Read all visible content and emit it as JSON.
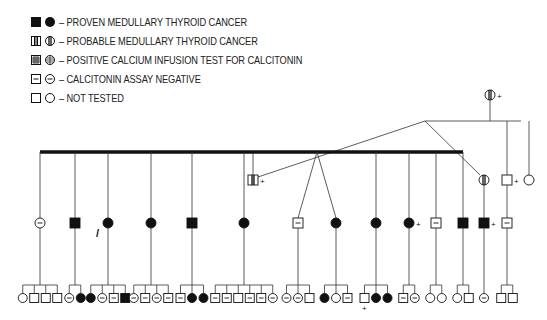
{
  "legend": [
    {
      "symbol": "filled",
      "label": "– PROVEN MEDULLARY THYROID CANCER"
    },
    {
      "symbol": "half-striped",
      "label": "– PROBABLE MEDULLARY THYROID CANCER"
    },
    {
      "symbol": "grid",
      "label": "– POSITIVE CALCIUM INFUSION TEST FOR CALCITONIN"
    },
    {
      "symbol": "minus",
      "label": "– CALCITONIN ASSAY NEGATIVE"
    },
    {
      "symbol": "empty",
      "label": "– NOT TESTED"
    }
  ],
  "colors": {
    "ink": "#111111",
    "line": "#333333"
  },
  "annotations": {
    "deceased_mark": "+",
    "proband_arrow": "↗"
  },
  "pedigree": {
    "generation_I": [
      {
        "sex": "female",
        "status": "half-striped",
        "deceased": true
      }
    ],
    "generation_II": [
      {
        "sex": "male",
        "status": "half-striped",
        "deceased": true
      },
      {
        "sex": "female",
        "status": "half-striped",
        "deceased": false
      },
      {
        "sex": "male",
        "status": "empty",
        "deceased": true
      },
      {
        "sex": "female",
        "status": "empty",
        "deceased": false
      }
    ],
    "generation_III": [
      {
        "sex": "female",
        "status": "minus",
        "children": [
          "F:empty",
          "M:empty",
          "M:empty",
          "M:empty"
        ]
      },
      {
        "sex": "male",
        "status": "filled",
        "children": [
          "F:minus",
          "F:filled"
        ]
      },
      {
        "sex": "female",
        "status": "filled",
        "proband": true,
        "children": [
          "F:filled",
          "F:minus",
          "M:minus",
          "M:filled"
        ]
      },
      {
        "sex": "female",
        "status": "filled",
        "children": [
          "F:minus",
          "M:minus",
          "F:minus",
          "M:minus"
        ]
      },
      {
        "sex": "male",
        "status": "filled",
        "children": [
          "M:minus",
          "F:filled",
          "F:filled"
        ]
      },
      {
        "sex": "female",
        "status": "filled",
        "children": [
          "M:minus",
          "M:minus",
          "M:empty",
          "M:minus",
          "M:minus",
          "F:minus"
        ]
      },
      {
        "sex": "male",
        "status": "minus",
        "twin": true,
        "children": [
          "F:minus",
          "F:minus",
          "M:empty"
        ]
      },
      {
        "sex": "female",
        "status": "filled",
        "twin": true,
        "children": [
          "F:filled",
          "F:empty",
          "M:minus"
        ]
      },
      {
        "sex": "female",
        "status": "filled",
        "children": [
          "M:empty+",
          "F:filled",
          "F:filled"
        ]
      },
      {
        "sex": "female",
        "status": "filled",
        "deceased": true,
        "children": [
          "M:minus",
          "F:minus"
        ]
      },
      {
        "sex": "male",
        "status": "minus",
        "children": [
          "F:empty",
          "F:empty"
        ]
      },
      {
        "sex": "male",
        "status": "filled",
        "children": [
          "F:empty",
          "M:empty"
        ]
      },
      {
        "sex": "male",
        "status": "filled",
        "deceased": true,
        "branch": "II-2",
        "children": [
          "F:minus"
        ]
      },
      {
        "sex": "male",
        "status": "minus",
        "branch": "II-3",
        "children": [
          "M:empty",
          "M:empty"
        ]
      }
    ]
  }
}
